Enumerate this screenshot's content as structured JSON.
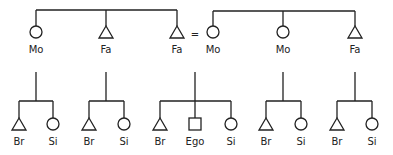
{
  "diagram": {
    "type": "kinship",
    "colors": {
      "line": "#222222",
      "background": "#ffffff"
    },
    "marriage_sign": "=",
    "parent_generation": [
      {
        "id": "p1",
        "label": "Mo",
        "symbol": "circle",
        "sibling_set": "left"
      },
      {
        "id": "p2",
        "label": "Fa",
        "symbol": "triangle",
        "sibling_set": "left"
      },
      {
        "id": "p3",
        "label": "Fa",
        "symbol": "triangle",
        "sibling_set": "left"
      },
      {
        "id": "p4",
        "label": "Mo",
        "symbol": "circle",
        "sibling_set": "right"
      },
      {
        "id": "p5",
        "label": "Mo",
        "symbol": "circle",
        "sibling_set": "right"
      },
      {
        "id": "p6",
        "label": "Fa",
        "symbol": "triangle",
        "sibling_set": "right"
      }
    ],
    "marriage": {
      "between": [
        "p3",
        "p4"
      ]
    },
    "child_generation": [
      {
        "parent": "p1",
        "children": [
          {
            "label": "Br",
            "symbol": "triangle"
          },
          {
            "label": "Si",
            "symbol": "circle"
          }
        ]
      },
      {
        "parent": "p2",
        "children": [
          {
            "label": "Br",
            "symbol": "triangle"
          },
          {
            "label": "Si",
            "symbol": "circle"
          }
        ]
      },
      {
        "parent": "p3+p4",
        "children": [
          {
            "label": "Br",
            "symbol": "triangle"
          },
          {
            "label": "Ego",
            "symbol": "square"
          },
          {
            "label": "Si",
            "symbol": "circle"
          }
        ]
      },
      {
        "parent": "p5",
        "children": [
          {
            "label": "Br",
            "symbol": "triangle"
          },
          {
            "label": "Si",
            "symbol": "circle"
          }
        ]
      },
      {
        "parent": "p6",
        "children": [
          {
            "label": "Br",
            "symbol": "triangle"
          },
          {
            "label": "Si",
            "symbol": "circle"
          }
        ]
      }
    ]
  }
}
